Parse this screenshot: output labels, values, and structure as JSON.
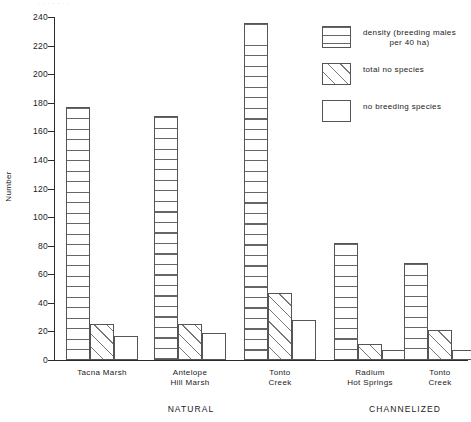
{
  "figure": {
    "caption_remnant": "·  ·          ·                   ·                  ·                                    ·    ·"
  },
  "chart_data": {
    "type": "bar",
    "title": "",
    "xlabel": "",
    "ylabel": "Number",
    "ylim": [
      0,
      240
    ],
    "ytick_step": 20,
    "yticks": [
      0,
      20,
      40,
      60,
      80,
      100,
      120,
      140,
      160,
      180,
      200,
      220,
      240
    ],
    "grid": false,
    "legend_position": "upper-right",
    "categories": [
      "Tacna Marsh",
      "Antelope\nHill Marsh",
      "Tonto\nCreek",
      "Radium\nHot Springs",
      "Tonto\nCreek"
    ],
    "group_labels": [
      "NATURAL",
      "CHANNELIZED"
    ],
    "group_spans": [
      [
        0,
        2
      ],
      [
        3,
        4
      ]
    ],
    "series": [
      {
        "name": "density (breeding males\nper 40 ha)",
        "pattern": "horizontal-lines",
        "values": [
          177,
          171,
          236,
          82,
          68
        ]
      },
      {
        "name": "total no species",
        "pattern": "diagonal-hatch",
        "values": [
          25,
          25,
          47,
          11,
          21
        ]
      },
      {
        "name": "no breeding species",
        "pattern": "open",
        "values": [
          17,
          19,
          28,
          7,
          7
        ]
      }
    ]
  }
}
